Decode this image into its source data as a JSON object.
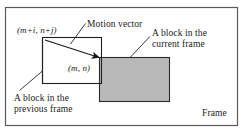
{
  "figure": {
    "frame_label": "Frame",
    "colors": {
      "frame_border": "#4a4a4a",
      "block_outline": "#1a1a1a",
      "current_block_fill": "#b8b8b8",
      "previous_block_fill": "#ffffff",
      "text": "#1a1a1a",
      "arrow": "#1a1a1a"
    },
    "labels": {
      "previous_block_coord": "(m+i, n+j)",
      "current_block_coord": "(m, n)",
      "motion_vector": "Motion vector",
      "current_block_line1": "A block in the",
      "current_block_line2": "current frame",
      "previous_block_line1": "A block in the",
      "previous_block_line2": "previous frame"
    },
    "shapes": {
      "frame": {
        "x": 5,
        "y": 7,
        "width": 233,
        "height": 119
      },
      "previous_block": {
        "x": 42,
        "y": 37,
        "width": 60,
        "height": 47
      },
      "current_block": {
        "x": 99,
        "y": 57,
        "width": 71,
        "height": 45
      }
    },
    "motion_vector_arrow": {
      "x1": 45,
      "y1": 40,
      "x2": 101,
      "y2": 58
    },
    "leader_lines": [
      {
        "name": "motion-vector-leader",
        "x1": 85,
        "y1": 24,
        "x2": 71,
        "y2": 44
      },
      {
        "name": "current-block-leader",
        "x1": 150,
        "y1": 36,
        "x2": 131,
        "y2": 57
      },
      {
        "name": "previous-block-leader",
        "x1": 20,
        "y1": 90,
        "x2": 43,
        "y2": 71
      }
    ]
  }
}
